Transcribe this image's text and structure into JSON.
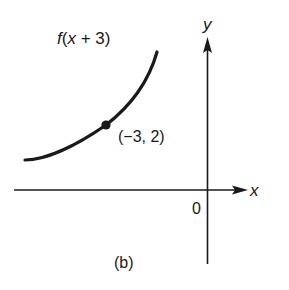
{
  "figure": {
    "function_label": "f(x + 3)",
    "point_label": "(−3, 2)",
    "x_axis_label": "x",
    "y_axis_label": "y",
    "origin_label": "0",
    "caption": "(b)"
  },
  "colors": {
    "ink": "#1a1a1a",
    "background": "#ffffff"
  }
}
